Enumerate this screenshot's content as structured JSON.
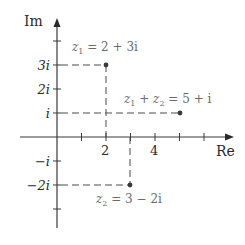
{
  "diagram": {
    "axes": {
      "x_label": "Re",
      "y_label": "Im",
      "x_ticks": [
        {
          "value": 1,
          "label": ""
        },
        {
          "value": 2,
          "label": "2"
        },
        {
          "value": 3,
          "label": ""
        },
        {
          "value": 4,
          "label": "4"
        },
        {
          "value": 5,
          "label": ""
        },
        {
          "value": 6,
          "label": ""
        }
      ],
      "y_ticks": [
        {
          "value": 4,
          "label": ""
        },
        {
          "value": 3,
          "label": "3i"
        },
        {
          "value": 2,
          "label": "2i"
        },
        {
          "value": 1,
          "label": "i"
        },
        {
          "value": -1,
          "label": "−i"
        },
        {
          "value": -2,
          "label": "−2i"
        },
        {
          "value": -3,
          "label": ""
        }
      ]
    },
    "points": [
      {
        "id": "z1",
        "re": 2,
        "im": 3,
        "label_lhs": "z",
        "label_sub": "1",
        "label_rhs": " = 2 + 3i"
      },
      {
        "id": "z2",
        "re": 3,
        "im": -2,
        "label_lhs": "z",
        "label_sub": "2",
        "label_rhs": " = 3 − 2i"
      },
      {
        "id": "sum",
        "re": 5,
        "im": 1,
        "label_lhs": "z",
        "label_sub": "1",
        "label_mid": " + z",
        "label_sub2": "2",
        "label_rhs": " = 5 + i"
      }
    ],
    "colors": {
      "axis": "#3a3a3a",
      "dash": "#4a4a4a",
      "point": "#3a3a3a",
      "label": "#2a2a2a",
      "label_light": "#6a6a6a"
    }
  }
}
